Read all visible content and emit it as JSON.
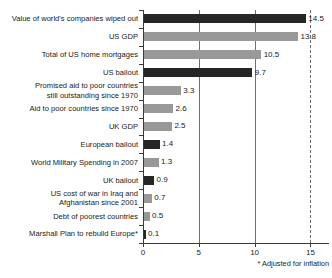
{
  "chart_data": {
    "type": "bar",
    "orientation": "horizontal",
    "title": "",
    "xlabel": "",
    "ylabel": "",
    "xlim": [
      0,
      16.7
    ],
    "xticks": [
      0,
      5,
      10,
      15
    ],
    "xtick_labels": [
      "0",
      "5",
      "10",
      "15"
    ],
    "grid": "vertical",
    "legend": "none",
    "footnote": "* Adjusted for inflation",
    "categories": [
      "Value of world's companies wiped out",
      "US GDP",
      "Total of US home mortgages",
      "US bailout",
      "Promised aid to poor countries\nstill outstanding since 1970",
      "Aid to poor countries since 1970",
      "UK GDP",
      "European bailout",
      "World Military Spending in 2007",
      "UK bailout",
      "US cost of war in Iraq and\nAfghanistan since 2001",
      "Debt of poorest countries",
      "Marshall Plan to rebuild Europe*"
    ],
    "values": [
      14.5,
      13.8,
      10.5,
      9.7,
      3.3,
      2.6,
      2.5,
      1.4,
      1.3,
      0.9,
      0.7,
      0.5,
      0.1
    ],
    "value_labels": [
      "14.5",
      "13.8",
      "10.5",
      "9.7",
      "3.3",
      "2.6",
      "2.5",
      "1.4",
      "1.3",
      "0.9",
      "0.7",
      "0.5",
      "0.1"
    ],
    "bar_shades": [
      "dark",
      "light",
      "light",
      "dark",
      "light",
      "light",
      "light",
      "dark",
      "light",
      "dark",
      "light",
      "light",
      "dark"
    ],
    "colors": {
      "dark": "#262626",
      "light": "#999999",
      "axis": "#3a3a3a",
      "gridline": "#6f6f6f",
      "text": "#1a1a1a",
      "background": "#ffffff"
    }
  }
}
